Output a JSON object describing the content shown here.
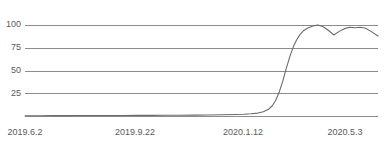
{
  "chart_data": {
    "type": "line",
    "title": "",
    "subtitle": "",
    "xlabel": "",
    "ylabel": "",
    "grid": true,
    "legend": false,
    "legend_position": "none",
    "ylim": [
      0,
      100
    ],
    "y_ticks": [
      100,
      75,
      50,
      25
    ],
    "y_tick_labels": [
      "100",
      "75",
      "50",
      "25"
    ],
    "x_tick_labels": [
      "2019.6.2",
      "2019.9.22",
      "2020.1.12",
      "2020.5.3"
    ],
    "x_tick_positions": [
      0,
      0.3116,
      0.6176,
      0.9066
    ],
    "series": [
      {
        "name": "value",
        "color": "#6b6b6b",
        "x": [
          0.0,
          0.04,
          0.08,
          0.12,
          0.16,
          0.2,
          0.24,
          0.28,
          0.32,
          0.36,
          0.4,
          0.44,
          0.48,
          0.52,
          0.56,
          0.6,
          0.62,
          0.64,
          0.66,
          0.675,
          0.69,
          0.7,
          0.71,
          0.72,
          0.73,
          0.74,
          0.75,
          0.76,
          0.77,
          0.78,
          0.79,
          0.8,
          0.815,
          0.83,
          0.845,
          0.86,
          0.875,
          0.89,
          0.905,
          0.92,
          0.935,
          0.95,
          0.965,
          0.98,
          1.0
        ],
        "values": [
          0.3,
          0.3,
          0.4,
          0.4,
          0.5,
          0.5,
          0.6,
          0.6,
          0.7,
          0.7,
          0.8,
          0.9,
          1.0,
          1.1,
          1.3,
          1.6,
          1.9,
          2.4,
          3.2,
          4.6,
          7.5,
          11.0,
          17.0,
          26.0,
          38.0,
          52.0,
          65.0,
          76.0,
          84.0,
          90.0,
          94.0,
          96.5,
          99.0,
          100.0,
          98.0,
          94.0,
          89.0,
          93.0,
          96.0,
          97.5,
          97.0,
          97.5,
          96.5,
          93.0,
          88.0
        ]
      }
    ]
  },
  "geometry": {
    "plot_left": 25,
    "plot_right": 378,
    "plot_top": 25,
    "plot_bottom": 116,
    "label_y_row": 129
  }
}
